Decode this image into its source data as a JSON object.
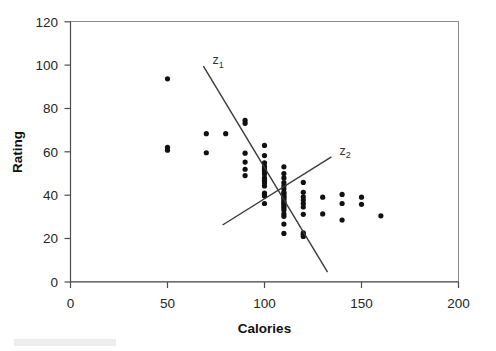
{
  "chart_data": {
    "type": "scatter",
    "title": "",
    "xlabel": "Calories",
    "ylabel": "Rating",
    "xlim": [
      0,
      200
    ],
    "ylim": [
      0,
      120
    ],
    "xticks": [
      0,
      50,
      100,
      150,
      200
    ],
    "yticks": [
      0,
      20,
      40,
      60,
      80,
      100,
      120
    ],
    "xtick_labels": [
      "0",
      "50",
      "100",
      "150",
      "200"
    ],
    "ytick_labels": [
      "0",
      "20",
      "40",
      "60",
      "80",
      "100",
      "120"
    ],
    "grid": false,
    "legend": "none",
    "marker": "filled-circle",
    "marker_color": "#111111",
    "series": [
      {
        "name": "cereals",
        "points": [
          [
            50,
            93.7
          ],
          [
            50,
            62.1
          ],
          [
            50,
            60.8
          ],
          [
            70,
            68.4
          ],
          [
            70,
            59.6
          ],
          [
            80,
            68.4
          ],
          [
            90,
            74.5
          ],
          [
            90,
            73.2
          ],
          [
            90,
            59.4
          ],
          [
            90,
            55.3
          ],
          [
            90,
            52.0
          ],
          [
            90,
            49.1
          ],
          [
            100,
            63.0
          ],
          [
            100,
            58.3
          ],
          [
            100,
            55.0
          ],
          [
            100,
            53.3
          ],
          [
            100,
            52.1
          ],
          [
            100,
            51.6
          ],
          [
            100,
            50.8
          ],
          [
            100,
            49.8
          ],
          [
            100,
            48.0
          ],
          [
            100,
            46.9
          ],
          [
            100,
            45.8
          ],
          [
            100,
            44.3
          ],
          [
            100,
            41.0
          ],
          [
            100,
            40.4
          ],
          [
            100,
            39.7
          ],
          [
            100,
            36.2
          ],
          [
            110,
            53.1
          ],
          [
            110,
            50.0
          ],
          [
            110,
            48.0
          ],
          [
            110,
            45.8
          ],
          [
            110,
            44.3
          ],
          [
            110,
            43.0
          ],
          [
            110,
            41.5
          ],
          [
            110,
            40.9
          ],
          [
            110,
            40.1
          ],
          [
            110,
            39.3
          ],
          [
            110,
            38.8
          ],
          [
            110,
            38.0
          ],
          [
            110,
            37.1
          ],
          [
            110,
            36.5
          ],
          [
            110,
            35.8
          ],
          [
            110,
            34.9
          ],
          [
            110,
            34.1
          ],
          [
            110,
            33.2
          ],
          [
            110,
            31.4
          ],
          [
            110,
            30.3
          ],
          [
            110,
            26.7
          ],
          [
            110,
            22.4
          ],
          [
            120,
            45.9
          ],
          [
            120,
            41.4
          ],
          [
            120,
            39.3
          ],
          [
            120,
            37.8
          ],
          [
            120,
            36.2
          ],
          [
            120,
            34.6
          ],
          [
            120,
            31.2
          ],
          [
            120,
            22.7
          ],
          [
            120,
            21.9
          ],
          [
            120,
            21.0
          ],
          [
            130,
            39.1
          ],
          [
            130,
            31.4
          ],
          [
            140,
            40.4
          ],
          [
            140,
            36.2
          ],
          [
            140,
            28.6
          ],
          [
            150,
            39.1
          ],
          [
            150,
            35.8
          ],
          [
            160,
            30.5
          ]
        ]
      }
    ],
    "fit_lines": [
      {
        "label": "z",
        "subscript": "1",
        "x_start": 68.5,
        "y_start": 99.6,
        "x_end": 132.5,
        "y_end": 4.6,
        "description": "steep negative discriminant direction"
      },
      {
        "label": "z",
        "subscript": "2",
        "x_start": 78.4,
        "y_start": 26.3,
        "x_end": 134.5,
        "y_end": 57.7,
        "description": "shallow positive discriminant direction"
      }
    ]
  },
  "axis": {
    "x_title": "Calories",
    "y_title": "Rating"
  }
}
